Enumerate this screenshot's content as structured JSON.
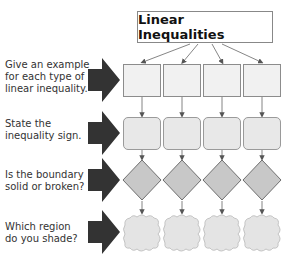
{
  "diagram": {
    "title": "Linear Inequalities",
    "rows": [
      {
        "id": "example",
        "label_lines": [
          "Give an example",
          "for each type of",
          "linear inequality."
        ],
        "shape": "square"
      },
      {
        "id": "sign",
        "label_lines": [
          "State the",
          "inequality sign."
        ],
        "shape": "rounded-rectangle"
      },
      {
        "id": "boundary",
        "label_lines": [
          "Is the boundary",
          "solid or broken?"
        ],
        "shape": "diamond"
      },
      {
        "id": "region",
        "label_lines": [
          "Which region",
          "do you shade?"
        ],
        "shape": "cloud"
      }
    ],
    "columns": 4,
    "colors": {
      "arrow": "#333333",
      "square_fill": "#f1f1f1",
      "rounded_fill": "#e8e8e8",
      "diamond_fill": "#c8c8c8",
      "cloud_fill": "#e4e4e4",
      "border": "#8c8c8c"
    }
  }
}
